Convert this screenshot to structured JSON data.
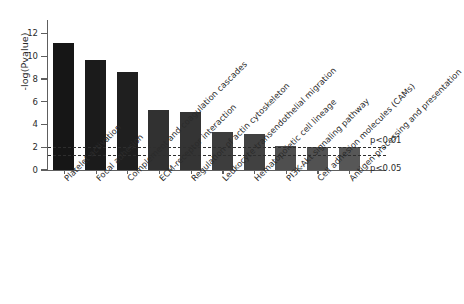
{
  "chart_data": {
    "type": "bar",
    "title": "",
    "xlabel": "",
    "ylabel": "-log(Pvalue)",
    "ylim": [
      0,
      13
    ],
    "yticks": [
      0,
      2,
      4,
      6,
      8,
      10,
      12
    ],
    "ytick_labels": [
      "0",
      "2",
      "4",
      "6",
      "8",
      "10",
      "12"
    ],
    "grid": false,
    "legend": "none",
    "orientation": "vertical",
    "categories": [
      "Platelet activation",
      "Focal adhesion",
      "Complement and coagulation cascades",
      "ECM-receptor interaction",
      "Regulation of actin cytoskeleton",
      "Leukocyte transendothelial migration",
      "Hematopoietic cell lineage",
      "PI3K-Akt signaling pathway",
      "Cell adhesion molecules (CAMs)",
      "Antigen processing and presentation"
    ],
    "values": [
      11.2,
      9.65,
      8.6,
      5.25,
      5.1,
      3.35,
      3.15,
      2.15,
      2.05,
      2.0
    ],
    "bar_colors": [
      "#161616",
      "#1b1b1b",
      "#1f1f1f",
      "#313131",
      "#343434",
      "#3d3d3d",
      "#414141",
      "#4f4f4f",
      "#525252",
      "#575757"
    ],
    "annotations": [
      {
        "name": "p<0.01",
        "label": "p<0.01",
        "value": 2.0
      },
      {
        "name": "p<0.05",
        "label": "p<0.05",
        "value": 1.3
      }
    ]
  }
}
